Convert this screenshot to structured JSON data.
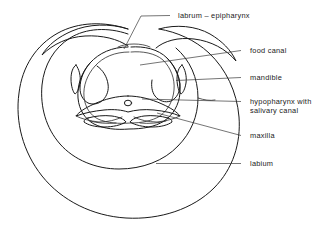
{
  "figure": {
    "type": "anatomical-diagram",
    "background_color": "#ffffff",
    "line_color": "#1a1a1a",
    "leader_color": "#3a3a3a",
    "width": 328,
    "height": 230
  },
  "labels": [
    {
      "id": "labrum-epipharynx",
      "text": "labrum – epipharynx",
      "x": 178,
      "y": 18,
      "dash_x1": 170,
      "dash_y1": 15.5,
      "dash_x2": 176,
      "dash_y2": 15.5,
      "leader": "M170,15.5 L141,16 L124,49"
    },
    {
      "id": "food-canal",
      "text": "food canal",
      "x": 250,
      "y": 53,
      "dash_x1": 241,
      "dash_y1": 50.5,
      "dash_x2": 248,
      "dash_y2": 50.5,
      "leader": "M241,50.5 L140,65"
    },
    {
      "id": "mandible",
      "text": "mandible",
      "x": 250,
      "y": 80,
      "dash_x1": 241,
      "dash_y1": 77.5,
      "dash_x2": 248,
      "dash_y2": 77.5,
      "leader": "M241,77.5 L176,80.5"
    },
    {
      "id": "hypopharynx",
      "text": "hypopharynx with",
      "text2": "salivary canal",
      "x": 250,
      "y": 104,
      "y2": 113,
      "dash_x1": 241,
      "dash_y1": 101.5,
      "dash_x2": 248,
      "dash_y2": 101.5,
      "leader": "M241,101.5 L142,99"
    },
    {
      "id": "maxilla",
      "text": "maxilla",
      "x": 250,
      "y": 138,
      "dash_x1": 241,
      "dash_y1": 135.5,
      "dash_x2": 248,
      "dash_y2": 135.5,
      "leader": "M241,135.5 L157,113"
    },
    {
      "id": "labium",
      "text": "labium",
      "x": 250,
      "y": 166,
      "dash_x1": 241,
      "dash_y1": 163.5,
      "dash_x2": 248,
      "dash_y2": 163.5,
      "leader": "M241,163.5 L156,163.5"
    }
  ],
  "shapes": {
    "labium_outer": "M128,29 C104,21 78,22 58,33 C36,45 22,67 19,93 C15,122 23,152 42,176 C62,201 93,216 126,218 C160,220 193,209 214,188 C233,169 241,143 239,117 C237,92 226,69 209,53 C195,40 177,32 159,29",
    "labium_inner_left": "M128,34 C108,27 86,28 70,38 C54,48 44,65 42,85 C40,107 46,128 60,144 C74,160 96,169 119,169 C142,169 164,161 178,146",
    "labium_tip_left": "M128,29 C110,23 88,24 72,31 C58,37 48,45 42,55 C53,44 68,37 85,36 C102,35 118,39 128,46",
    "labium_tip_right": "M159,29 C176,24 196,26 210,34 C222,41 231,50 236,61 C226,49 211,41 194,39 C178,37 164,41 156,48",
    "labium_inner_right": "M178,146 C191,133 198,116 198,98 C198,78 190,60 176,48",
    "labium_inner_right2": "M198,98 C204,100 210,101 215,100",
    "food_canal_outer": "M128,47 C112,47 99,53 90,63 C81,73 77,86 78,98 C79,110 85,119 94,124 C104,129 117,130 129,129 C142,129 155,127 164,121 C173,115 179,105 180,93 C181,80 176,67 167,58 C158,49 144,46 131,47",
    "food_canal_inner": "M129,52 C115,52 103,57 95,66 C87,75 83,86 84,97 C85,107 90,115 98,119 C107,123 119,124 130,123 C141,123 152,121 160,116 C168,110 173,101 174,90 C175,79 171,68 163,60 C155,53 142,51 131,52",
    "epipharynx_bracket": "M118,47 C122,45 128,44 134,44 C140,44 146,45 150,47",
    "mandible_left": "M76,65 C79,69 81,76 80,83 C79,89 77,93 75,94 C73,92 71,86 71,79 C71,72 73,67 76,65 Z",
    "mandible_right": "M182,65 C185,69 187,76 186,83 C185,89 183,93 181,94 C179,92 177,86 177,79 C177,72 179,67 182,65 Z",
    "lobe_left_upper": "M90,63 C84,70 80,79 80,88 C80,95 83,100 88,103 C93,105 99,104 103,100 C107,96 109,90 108,84 C107,77 103,70 97,66",
    "lobe_right_upper": "M167,58 C174,65 179,74 180,84 C180,92 177,98 171,101 C165,103 159,101 155,96 C152,92 151,86 152,80",
    "hypopharynx": "M128,96 C117,96 105,99 94,104 C85,108 79,112 76,116 C84,113 94,111 104,110 C114,109 122,110 128,112 C135,110 144,109 154,110 C164,111 173,113 180,116 C177,112 171,108 162,104 C151,99 139,96 128,96 Z",
    "hypopharynx_wing_left": "M76,116 C82,119 90,121 99,122 C108,122 116,120 122,117",
    "hypopharynx_wing_right": "M180,116 C174,119 166,121 157,122 C148,122 140,120 134,117",
    "salivary_canal_cx": 128,
    "salivary_canal_cy": 103,
    "salivary_canal_rx": 3.6,
    "salivary_canal_ry": 2.8,
    "maxilla_left": "M88,118 C95,116 104,115 112,116 C119,117 124,119 126,122 C121,125 113,127 104,127 C95,127 88,125 84,122 C84,120 86,118 88,118 Z",
    "maxilla_right": "M168,118 C161,116 152,115 144,116 C137,117 132,119 130,122 C135,125 143,127 152,127 C161,127 168,125 172,122 C172,120 170,118 168,118 Z",
    "maxilla_left_inner": "M90,121 C97,123 107,124 116,123",
    "maxilla_right_inner": "M166,121 C159,123 149,124 140,123"
  }
}
